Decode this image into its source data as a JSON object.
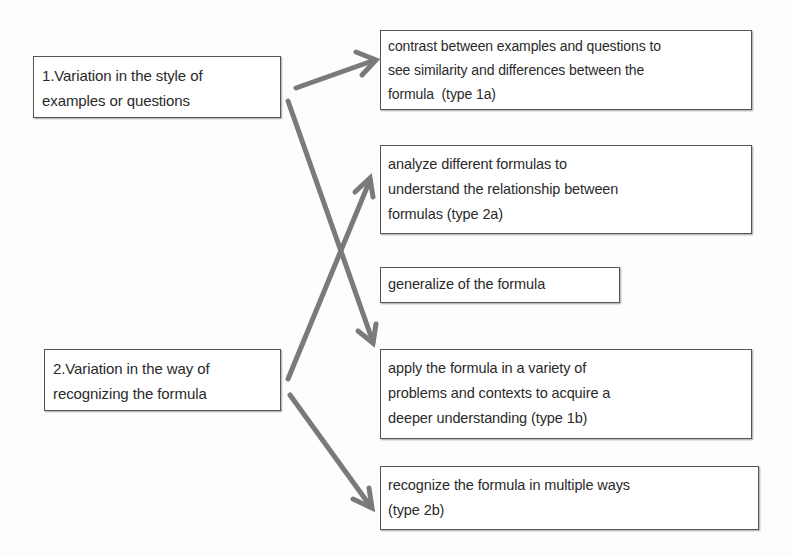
{
  "diagram": {
    "sources": [
      {
        "id": "source-1",
        "lines": [
          "1.Variation in the style of",
          "examples or questions"
        ]
      },
      {
        "id": "source-2",
        "lines": [
          "2.Variation in the way of",
          "recognizing the formula"
        ]
      }
    ],
    "targets": [
      {
        "id": "type-1a",
        "lines": [
          "contrast between examples and questions to",
          "see similarity and differences between the",
          "formula  (type 1a)"
        ]
      },
      {
        "id": "type-2a",
        "lines": [
          "analyze different formulas to",
          "understand the relationship between",
          "formulas (type 2a)"
        ]
      },
      {
        "id": "generalize",
        "lines": [
          "generalize of the formula"
        ]
      },
      {
        "id": "type-1b",
        "lines": [
          "apply the formula in a variety of",
          "problems and contexts to acquire a",
          "deeper understanding (type 1b)"
        ]
      },
      {
        "id": "type-2b",
        "lines": [
          "recognize the formula in multiple ways",
          "(type 2b)"
        ]
      }
    ],
    "edges": [
      {
        "from": "source-1",
        "to": "type-1a"
      },
      {
        "from": "source-1",
        "to": "type-1b"
      },
      {
        "from": "source-2",
        "to": "type-2a"
      },
      {
        "from": "source-2",
        "to": "type-2b"
      }
    ],
    "colors": {
      "arrow": "#7a7a7a",
      "border": "#555555",
      "text": "#2a2a2a",
      "background": "#fdfdfd"
    }
  }
}
